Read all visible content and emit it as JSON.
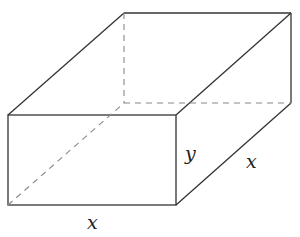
{
  "diagram": {
    "type": "rectangular box (open-top prism) with hidden edges dashed",
    "labels": {
      "height": "y",
      "depth": "x",
      "width": "x"
    },
    "colors": {
      "edge": "#333333",
      "hidden_edge": "#888888",
      "background": "#ffffff"
    }
  }
}
